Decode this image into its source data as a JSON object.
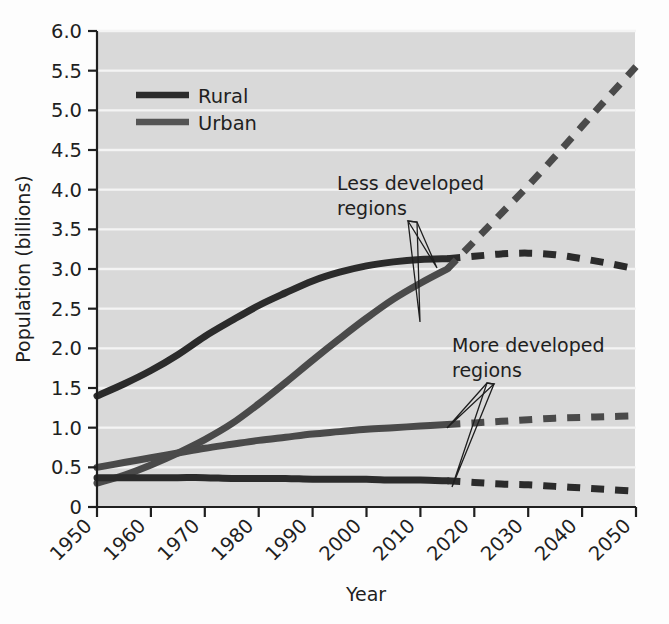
{
  "chart_data": {
    "type": "line",
    "title": "",
    "xlabel": "Year",
    "ylabel": "Population (billions)",
    "xlim": [
      1950,
      2050
    ],
    "ylim": [
      0,
      6.0
    ],
    "grid": "horizontal-white-gridlines",
    "plot_background": "#d9d9d9",
    "legend_position": "top-left-inside",
    "x_tick_labels": [
      "1950",
      "1960",
      "1970",
      "1980",
      "1990",
      "2000",
      "2010",
      "2020",
      "2030",
      "2040",
      "2050"
    ],
    "x_tick_values": [
      1950,
      1960,
      1970,
      1980,
      1990,
      2000,
      2010,
      2020,
      2030,
      2040,
      2050
    ],
    "y_tick_labels": [
      "0",
      "0.5",
      "1.0",
      "1.5",
      "2.0",
      "2.5",
      "3.0",
      "3.5",
      "4.0",
      "4.5",
      "5.0",
      "5.5",
      "6.0"
    ],
    "y_tick_values": [
      0,
      0.5,
      1.0,
      1.5,
      2.0,
      2.5,
      3.0,
      3.5,
      4.0,
      4.5,
      5.0,
      5.5,
      6.0
    ],
    "legend": [
      {
        "name": "Rural",
        "color": "#2b2b2b"
      },
      {
        "name": "Urban",
        "color": "#555555"
      }
    ],
    "annotations": [
      {
        "text_line1": "Less developed",
        "text_line2": "regions",
        "x": 2002,
        "y": 4.05
      },
      {
        "text_line1": "More developed",
        "text_line2": "regions",
        "x": 2024,
        "y": 2.25
      }
    ],
    "series": [
      {
        "name": "Rural — less developed regions",
        "legend_key": "Rural",
        "region": "Less developed regions",
        "color": "#2b2b2b",
        "historical_style": "solid",
        "projection_style": "dashed",
        "projection_start_year": 2015,
        "x": [
          1950,
          1955,
          1960,
          1965,
          1970,
          1975,
          1980,
          1985,
          1990,
          1995,
          2000,
          2005,
          2010,
          2015,
          2020,
          2025,
          2030,
          2035,
          2040,
          2045,
          2050
        ],
        "values": [
          1.4,
          1.55,
          1.72,
          1.92,
          2.15,
          2.35,
          2.54,
          2.7,
          2.85,
          2.96,
          3.04,
          3.09,
          3.12,
          3.13,
          3.16,
          3.19,
          3.2,
          3.18,
          3.13,
          3.07,
          3.0
        ]
      },
      {
        "name": "Urban — less developed regions",
        "legend_key": "Urban",
        "region": "Less developed regions",
        "color": "#4a4a4a",
        "historical_style": "solid",
        "projection_style": "dashed",
        "projection_start_year": 2015,
        "x": [
          1950,
          1955,
          1960,
          1965,
          1970,
          1975,
          1980,
          1985,
          1990,
          1995,
          2000,
          2005,
          2010,
          2015,
          2020,
          2025,
          2030,
          2035,
          2040,
          2045,
          2050
        ],
        "values": [
          0.3,
          0.4,
          0.53,
          0.68,
          0.85,
          1.05,
          1.3,
          1.57,
          1.85,
          2.12,
          2.38,
          2.62,
          2.82,
          3.0,
          3.35,
          3.7,
          4.05,
          4.42,
          4.8,
          5.18,
          5.55
        ]
      },
      {
        "name": "Urban — more developed regions",
        "legend_key": "Urban",
        "region": "More developed regions",
        "color": "#4a4a4a",
        "historical_style": "solid",
        "projection_style": "dashed",
        "projection_start_year": 2015,
        "x": [
          1950,
          1955,
          1960,
          1965,
          1970,
          1975,
          1980,
          1985,
          1990,
          1995,
          2000,
          2005,
          2010,
          2015,
          2020,
          2025,
          2030,
          2035,
          2040,
          2045,
          2050
        ],
        "values": [
          0.5,
          0.56,
          0.62,
          0.68,
          0.74,
          0.79,
          0.84,
          0.88,
          0.92,
          0.95,
          0.98,
          1.0,
          1.02,
          1.04,
          1.06,
          1.08,
          1.1,
          1.12,
          1.13,
          1.14,
          1.15
        ]
      },
      {
        "name": "Rural — more developed regions",
        "legend_key": "Rural",
        "region": "More developed regions",
        "color": "#2b2b2b",
        "historical_style": "solid",
        "projection_style": "dashed",
        "projection_start_year": 2015,
        "x": [
          1950,
          1955,
          1960,
          1965,
          1970,
          1975,
          1980,
          1985,
          1990,
          1995,
          2000,
          2005,
          2010,
          2015,
          2020,
          2025,
          2030,
          2035,
          2040,
          2045,
          2050
        ],
        "values": [
          0.37,
          0.37,
          0.37,
          0.37,
          0.37,
          0.36,
          0.36,
          0.36,
          0.35,
          0.35,
          0.35,
          0.34,
          0.34,
          0.33,
          0.31,
          0.29,
          0.28,
          0.26,
          0.24,
          0.22,
          0.2
        ]
      }
    ]
  },
  "axes": {
    "y_title": "Population (billions)",
    "x_title": "Year"
  },
  "legend": {
    "items": [
      {
        "label": "Rural"
      },
      {
        "label": "Urban"
      }
    ]
  },
  "annotations": {
    "less_developed": {
      "line1": "Less developed",
      "line2": "regions"
    },
    "more_developed": {
      "line1": "More developed",
      "line2": "regions"
    }
  }
}
